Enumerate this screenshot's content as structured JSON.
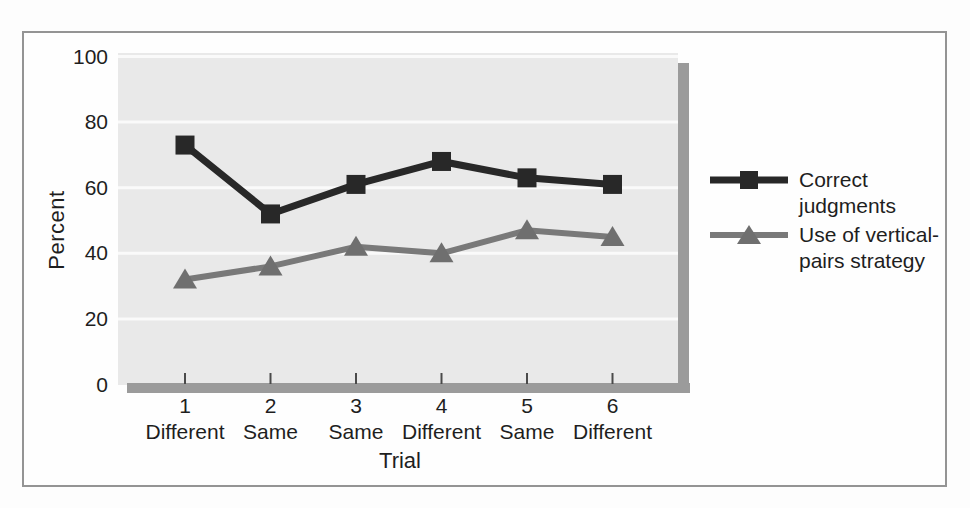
{
  "colors": {
    "page_background": "#fdfdfd",
    "frame_border": "#949494",
    "plot_background": "#e9e9e9",
    "gridline": "#fafafa",
    "tick_mark": "#4a4a4a",
    "axis_shadow": "#9b9b9b",
    "text": "#1e1e1e",
    "series_correct": "#282828",
    "series_strategy": "#797979"
  },
  "legend": {
    "items": [
      {
        "marker": "square",
        "lines": [
          "Correct",
          "judgments"
        ]
      },
      {
        "marker": "triangle",
        "lines": [
          "Use of vertical-",
          "pairs strategy"
        ]
      }
    ]
  },
  "chart_data": {
    "type": "line",
    "title": "",
    "xlabel": "Trial",
    "ylabel": "Percent",
    "x": [
      1,
      2,
      3,
      4,
      5,
      6
    ],
    "x_tick_labels": [
      "1",
      "2",
      "3",
      "4",
      "5",
      "6"
    ],
    "x_condition_labels": [
      "Different",
      "Same",
      "Same",
      "Different",
      "Same",
      "Different"
    ],
    "y_ticks": [
      0,
      20,
      40,
      60,
      80,
      100
    ],
    "ylim": [
      0,
      100
    ],
    "grid": "horizontal",
    "legend_position": "right",
    "series": [
      {
        "name": "Correct judgments",
        "marker": "square",
        "color": "#282828",
        "values": [
          73,
          52,
          61,
          68,
          63,
          61
        ]
      },
      {
        "name": "Use of vertical-pairs strategy",
        "marker": "triangle",
        "color": "#797979",
        "values": [
          32,
          36,
          42,
          40,
          47,
          45
        ]
      }
    ]
  }
}
